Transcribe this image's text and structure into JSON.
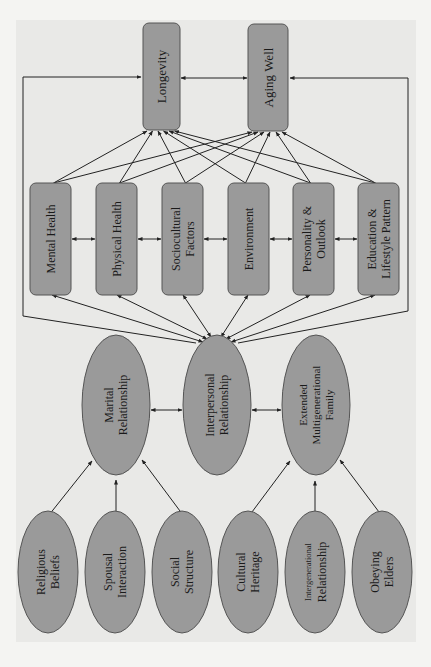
{
  "diagram": {
    "orientation": "rotated-90-ccw",
    "colors": {
      "node_fill": "#9a9a9a",
      "node_stroke": "#555555",
      "edge": "#222222",
      "panel": "#e9e9e7"
    },
    "outcomes": [
      {
        "id": "longevity",
        "label": "Longevity"
      },
      {
        "id": "aging_well",
        "label": "Aging Well"
      }
    ],
    "factors": [
      {
        "id": "mental_health",
        "lines": [
          "Mental Health"
        ]
      },
      {
        "id": "physical_health",
        "lines": [
          "Physical Health"
        ]
      },
      {
        "id": "sociocultural",
        "lines": [
          "Sociocultural",
          "Factors"
        ]
      },
      {
        "id": "environment",
        "lines": [
          "Environment"
        ]
      },
      {
        "id": "personality",
        "lines": [
          "Personality &",
          "Outlook"
        ]
      },
      {
        "id": "education",
        "lines": [
          "Education &",
          "Lifestyle Pattern"
        ]
      }
    ],
    "relationships": [
      {
        "id": "marital",
        "lines": [
          "Marital",
          "Relationship"
        ]
      },
      {
        "id": "interpersonal",
        "lines": [
          "Interpersonal",
          "Relationship"
        ]
      },
      {
        "id": "extended",
        "lines": [
          "Extended",
          "Multigenerational",
          "Family"
        ]
      }
    ],
    "antecedents": [
      {
        "id": "religious",
        "lines": [
          "Religious",
          "Beliefs"
        ],
        "target": "marital"
      },
      {
        "id": "spousal",
        "lines": [
          "Spousal",
          "Interaction"
        ],
        "target": "marital"
      },
      {
        "id": "social",
        "lines": [
          "Social",
          "Structure"
        ],
        "target": "marital"
      },
      {
        "id": "cultural",
        "lines": [
          "Cultural",
          "Heritage"
        ],
        "target": "extended"
      },
      {
        "id": "intergenerational",
        "lines": [
          "Intergenerational",
          "Relationship"
        ],
        "target": "extended"
      },
      {
        "id": "obeying",
        "lines": [
          "Obeying",
          "Elders"
        ],
        "target": "extended"
      }
    ],
    "edges_summary": [
      "Each factor -> Longevity and Aging Well",
      "Longevity <-> Aging Well",
      "Adjacent factors <-> each other",
      "Interpersonal Relationship <-> each factor",
      "Interpersonal Relationship -> Longevity and Aging Well (side loops)",
      "Marital Relationship <-> Interpersonal Relationship <-> Extended Multigenerational Family",
      "Antecedents -> Marital / Extended family"
    ]
  }
}
